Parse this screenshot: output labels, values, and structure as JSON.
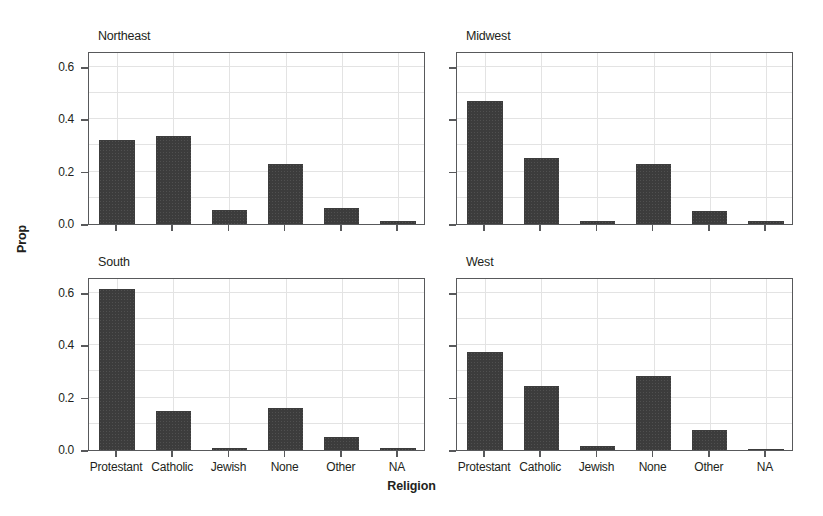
{
  "chart_data": {
    "type": "bar",
    "title": "",
    "xlabel": "Religion",
    "ylabel": "Prop",
    "ylim": [
      0.0,
      0.66
    ],
    "grid": true,
    "legend": "none",
    "facet_layout": "2x2",
    "categories": [
      "Protestant",
      "Catholic",
      "Jewish",
      "None",
      "Other",
      "NA"
    ],
    "ytick_labels": [
      "0.0",
      "0.2",
      "0.4",
      "0.6"
    ],
    "ytick_values": [
      0.0,
      0.2,
      0.4,
      0.6
    ],
    "panels": [
      {
        "title": "Northeast",
        "row": 0,
        "col": 0,
        "values": [
          0.32,
          0.335,
          0.055,
          0.23,
          0.06,
          0.01
        ],
        "show_ylabels": true,
        "show_xlabels": false
      },
      {
        "title": "Midwest",
        "row": 0,
        "col": 1,
        "values": [
          0.47,
          0.25,
          0.01,
          0.23,
          0.05,
          0.012
        ],
        "show_ylabels": false,
        "show_xlabels": false
      },
      {
        "title": "South",
        "row": 1,
        "col": 0,
        "values": [
          0.615,
          0.148,
          0.008,
          0.16,
          0.048,
          0.008
        ],
        "show_ylabels": true,
        "show_xlabels": true
      },
      {
        "title": "West",
        "row": 1,
        "col": 1,
        "values": [
          0.375,
          0.243,
          0.015,
          0.283,
          0.075,
          0.005
        ],
        "show_ylabels": false,
        "show_xlabels": true
      }
    ],
    "colors": {
      "bar": "#3c3c3c",
      "grid": "#e3e3e3",
      "axis": "#58595b",
      "background": "#ffffff",
      "text": "#231f20"
    }
  }
}
